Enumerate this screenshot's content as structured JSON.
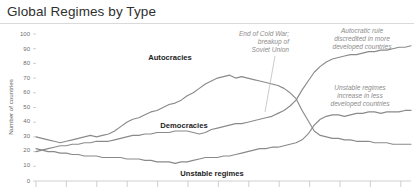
{
  "header": {
    "title": "Global Regimes by Type"
  },
  "chart_data": {
    "type": "line",
    "title": "Global Regimes by Type",
    "xlabel": "",
    "ylabel": "Number of countries",
    "ylim": [
      0,
      100
    ],
    "xlim": [
      1946,
      2008
    ],
    "yticks": [
      0,
      10,
      20,
      30,
      40,
      50,
      60,
      70,
      80,
      90,
      100
    ],
    "ytick_labels": [
      "0",
      "10",
      "20",
      "30",
      "40",
      "50",
      "60",
      "70",
      "80",
      "90",
      "100"
    ],
    "grid": false,
    "legend_position": "inline-labels",
    "x": [
      1946,
      1947,
      1948,
      1949,
      1950,
      1951,
      1952,
      1953,
      1954,
      1955,
      1956,
      1957,
      1958,
      1959,
      1960,
      1961,
      1962,
      1963,
      1964,
      1965,
      1966,
      1967,
      1968,
      1969,
      1970,
      1971,
      1972,
      1973,
      1974,
      1975,
      1976,
      1977,
      1978,
      1979,
      1980,
      1981,
      1982,
      1983,
      1984,
      1985,
      1986,
      1987,
      1988,
      1989,
      1990,
      1991,
      1992,
      1993,
      1994,
      1995,
      1996,
      1997,
      1998,
      1999,
      2000,
      2001,
      2002,
      2003,
      2004,
      2005,
      2006,
      2007,
      2008
    ],
    "series": [
      {
        "name": "Autocracies",
        "label": "Autocracies",
        "color": "#8a8a8a",
        "values": [
          30,
          29,
          28,
          27,
          26,
          27,
          28,
          29,
          30,
          31,
          30,
          31,
          32,
          34,
          37,
          40,
          42,
          43,
          45,
          47,
          48,
          50,
          52,
          53,
          55,
          58,
          60,
          63,
          66,
          68,
          70,
          71,
          72,
          70,
          71,
          70,
          69,
          68,
          67,
          66,
          65,
          63,
          60,
          56,
          48,
          41,
          34,
          31,
          30,
          29,
          29,
          28,
          28,
          27,
          27,
          27,
          26,
          26,
          26,
          25,
          25,
          25,
          25
        ]
      },
      {
        "name": "Democracies",
        "label": "Democracies",
        "color": "#8a8a8a",
        "values": [
          20,
          21,
          22,
          23,
          24,
          24,
          25,
          25,
          26,
          26,
          27,
          27,
          27,
          28,
          29,
          30,
          31,
          31,
          32,
          32,
          33,
          33,
          33,
          34,
          34,
          34,
          33,
          32,
          33,
          35,
          36,
          37,
          38,
          39,
          39,
          40,
          41,
          42,
          43,
          44,
          46,
          48,
          51,
          55,
          62,
          68,
          74,
          78,
          81,
          83,
          84,
          85,
          86,
          86,
          87,
          88,
          88,
          89,
          89,
          90,
          91,
          91,
          92
        ]
      },
      {
        "name": "Unstable regimes",
        "label": "Unstable regimes",
        "color": "#8a8a8a",
        "values": [
          22,
          21,
          20,
          20,
          19,
          19,
          18,
          18,
          17,
          17,
          17,
          16,
          16,
          16,
          16,
          15,
          15,
          15,
          14,
          14,
          13,
          13,
          13,
          12,
          13,
          13,
          14,
          15,
          16,
          16,
          16,
          17,
          17,
          18,
          19,
          20,
          21,
          22,
          22,
          23,
          23,
          24,
          25,
          26,
          28,
          32,
          38,
          42,
          44,
          45,
          45,
          44,
          45,
          46,
          46,
          47,
          47,
          46,
          47,
          47,
          47,
          48,
          48
        ]
      }
    ],
    "annotations": [
      {
        "name": "cold-war-annotation",
        "text_lines": [
          "End of Cold War;",
          "breakup of",
          "Soviet Union"
        ],
        "align": "right"
      },
      {
        "name": "autocratic-rule-annotation",
        "text_lines": [
          "Autocratic rule",
          "discredited in more",
          "developed countries"
        ],
        "align": "center"
      },
      {
        "name": "unstable-regimes-annotation",
        "text_lines": [
          "Unstable regimes",
          "increase in less",
          "developed countries"
        ],
        "align": "center"
      }
    ]
  }
}
